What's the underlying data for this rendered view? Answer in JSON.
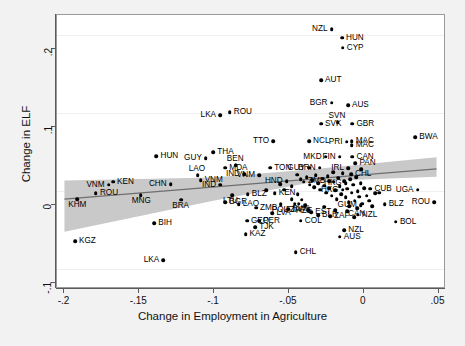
{
  "chart_data": {
    "type": "scatter",
    "title": "",
    "xlabel": "Change in Employment in Agriculture",
    "ylabel": "Change in ELF",
    "xlim": [
      -0.205,
      0.055
    ],
    "ylim": [
      -0.125,
      0.225
    ],
    "xticks": [
      -0.2,
      -0.15,
      -0.1,
      -0.05,
      0,
      0.05
    ],
    "xtick_labels": [
      "-.2",
      "-.15",
      "-.1",
      "-.05",
      "0",
      ".05"
    ],
    "yticks": [
      0.2,
      0.1,
      0,
      -0.1
    ],
    "ytick_labels": [
      ".2",
      ".1",
      "0",
      "-.1"
    ],
    "grid": true,
    "legend": "none",
    "marker_color": "#000000",
    "fit_line_color": "#6e6e6e",
    "ci_band_color": "#c9c9c9",
    "background_color": "#ffffff",
    "page_background": "#f2f2f2",
    "fit_line": {
      "x0": -0.2,
      "y0": -0.012,
      "x1": 0.05,
      "y1": 0.027
    },
    "ci_band": {
      "upper": [
        [
          -0.2,
          0.012
        ],
        [
          -0.1,
          0.016
        ],
        [
          -0.03,
          0.027
        ],
        [
          0.05,
          0.042
        ]
      ],
      "lower": [
        [
          -0.2,
          -0.054
        ],
        [
          -0.1,
          -0.014
        ],
        [
          -0.03,
          0.011
        ],
        [
          0.05,
          0.017
        ]
      ]
    },
    "points": [
      {
        "label": "NZL",
        "x": -0.0215,
        "y": 0.207,
        "pos": "left"
      },
      {
        "label": "HUN",
        "x": -0.0145,
        "y": 0.196,
        "pos": "right"
      },
      {
        "label": "CYP",
        "x": -0.014,
        "y": 0.183,
        "pos": "right"
      },
      {
        "label": "AUT",
        "x": -0.0285,
        "y": 0.142,
        "pos": "right"
      },
      {
        "label": "BGR",
        "x": -0.0215,
        "y": 0.113,
        "pos": "left"
      },
      {
        "label": "AUS",
        "x": -0.0105,
        "y": 0.11,
        "pos": "right"
      },
      {
        "label": "ROU",
        "x": -0.0895,
        "y": 0.101,
        "pos": "right"
      },
      {
        "label": "LKA",
        "x": -0.096,
        "y": 0.097,
        "pos": "left"
      },
      {
        "label": "SVN",
        "x": -0.0175,
        "y": 0.088,
        "pos": "above"
      },
      {
        "label": "SVK",
        "x": -0.0285,
        "y": 0.086,
        "pos": "right"
      },
      {
        "label": "GBR",
        "x": -0.0075,
        "y": 0.086,
        "pos": "right"
      },
      {
        "label": "BWA",
        "x": 0.0345,
        "y": 0.069,
        "pos": "right"
      },
      {
        "label": "NCL",
        "x": -0.0365,
        "y": 0.064,
        "pos": "right"
      },
      {
        "label": "TTO",
        "x": -0.0605,
        "y": 0.064,
        "pos": "left"
      },
      {
        "label": "PRI",
        "x": -0.0115,
        "y": 0.063,
        "pos": "left"
      },
      {
        "label": "MAC",
        "x": -0.008,
        "y": 0.064,
        "pos": "right"
      },
      {
        "label": "MAC",
        "x": -0.008,
        "y": 0.059,
        "pos": "right"
      },
      {
        "label": "THA",
        "x": -0.1005,
        "y": 0.05,
        "pos": "right"
      },
      {
        "label": "HUN",
        "x": -0.1385,
        "y": 0.045,
        "pos": "right"
      },
      {
        "label": "GUY",
        "x": -0.1055,
        "y": 0.042,
        "pos": "left"
      },
      {
        "label": "MKD",
        "x": -0.0255,
        "y": 0.044,
        "pos": "left"
      },
      {
        "label": "FIN",
        "x": -0.016,
        "y": 0.044,
        "pos": "left"
      },
      {
        "label": "CAN",
        "x": -0.0075,
        "y": 0.044,
        "pos": "right"
      },
      {
        "label": "PAN",
        "x": -0.0055,
        "y": 0.036,
        "pos": "right"
      },
      {
        "label": "BEN",
        "x": -0.0855,
        "y": 0.033,
        "pos": "above"
      },
      {
        "label": "MDA",
        "x": -0.0925,
        "y": 0.03,
        "pos": "right"
      },
      {
        "label": "TON",
        "x": -0.0625,
        "y": 0.03,
        "pos": "right"
      },
      {
        "label": "GUY",
        "x": -0.0365,
        "y": 0.03,
        "pos": "left"
      },
      {
        "label": "BRN",
        "x": -0.0295,
        "y": 0.03,
        "pos": "left"
      },
      {
        "label": "IRL",
        "x": -0.0105,
        "y": 0.029,
        "pos": "left"
      },
      {
        "label": "CHL",
        "x": -0.0085,
        "y": 0.022,
        "pos": "right"
      },
      {
        "label": "LAO",
        "x": -0.111,
        "y": 0.02,
        "pos": "above"
      },
      {
        "label": "IND",
        "x": -0.08,
        "y": 0.022,
        "pos": "left"
      },
      {
        "label": "VNM",
        "x": -0.07,
        "y": 0.02,
        "pos": "left"
      },
      {
        "label": "VNM",
        "x": -0.109,
        "y": 0.014,
        "pos": "right"
      },
      {
        "label": "CHN",
        "x": -0.129,
        "y": 0.009,
        "pos": "left"
      },
      {
        "label": "IND",
        "x": -0.096,
        "y": 0.008,
        "pos": "left"
      },
      {
        "label": "HKG",
        "x": -0.012,
        "y": 0.01,
        "pos": "left"
      },
      {
        "label": "ZMB",
        "x": -0.023,
        "y": 0.013,
        "pos": "left"
      },
      {
        "label": "HND",
        "x": -0.0515,
        "y": 0.013,
        "pos": "left"
      },
      {
        "label": "HKG",
        "x": -0.014,
        "y": 0.002,
        "pos": "left"
      },
      {
        "label": "CUB",
        "x": 0.0045,
        "y": 0.003,
        "pos": "right"
      },
      {
        "label": "UGA",
        "x": 0.036,
        "y": 0.002,
        "pos": "left"
      },
      {
        "label": "VNM",
        "x": -0.1705,
        "y": 0.008,
        "pos": "left"
      },
      {
        "label": "KEN",
        "x": -0.1675,
        "y": 0.012,
        "pos": "right"
      },
      {
        "label": "ROU",
        "x": -0.179,
        "y": -0.003,
        "pos": "right"
      },
      {
        "label": "KHM",
        "x": -0.1915,
        "y": -0.01,
        "pos": "below"
      },
      {
        "label": "MNG",
        "x": -0.149,
        "y": -0.005,
        "pos": "below"
      },
      {
        "label": "BRA",
        "x": -0.122,
        "y": -0.011,
        "pos": "below"
      },
      {
        "label": "LTU",
        "x": -0.088,
        "y": -0.005,
        "pos": "below"
      },
      {
        "label": "BLZ",
        "x": -0.0775,
        "y": -0.004,
        "pos": "right"
      },
      {
        "label": "KEN",
        "x": -0.0595,
        "y": -0.003,
        "pos": "right"
      },
      {
        "label": "BGR",
        "x": -0.0925,
        "y": -0.014,
        "pos": "right"
      },
      {
        "label": "LAO",
        "x": -0.0835,
        "y": -0.017,
        "pos": "right"
      },
      {
        "label": "ZMB",
        "x": -0.072,
        "y": -0.021,
        "pos": "right"
      },
      {
        "label": "POL",
        "x": -0.0555,
        "y": -0.017,
        "pos": "below"
      },
      {
        "label": "FJI",
        "x": -0.046,
        "y": -0.016,
        "pos": "below"
      },
      {
        "label": "ZAF",
        "x": -0.0435,
        "y": -0.016,
        "pos": "below"
      },
      {
        "label": "AZE",
        "x": -0.039,
        "y": -0.018,
        "pos": "below"
      },
      {
        "label": "RWA",
        "x": -0.0505,
        "y": -0.023,
        "pos": "right"
      },
      {
        "label": "LVA",
        "x": -0.061,
        "y": -0.028,
        "pos": "right"
      },
      {
        "label": "EST",
        "x": -0.035,
        "y": -0.027,
        "pos": "right"
      },
      {
        "label": "BLR",
        "x": -0.0305,
        "y": -0.031,
        "pos": "right"
      },
      {
        "label": "ZAF",
        "x": -0.0225,
        "y": -0.032,
        "pos": "right"
      },
      {
        "label": "COL",
        "x": -0.042,
        "y": -0.038,
        "pos": "right"
      },
      {
        "label": "GEO",
        "x": -0.078,
        "y": -0.038,
        "pos": "right"
      },
      {
        "label": "PER",
        "x": -0.07,
        "y": -0.038,
        "pos": "right"
      },
      {
        "label": "TJK",
        "x": -0.0725,
        "y": -0.046,
        "pos": "right"
      },
      {
        "label": "KAZ",
        "x": -0.079,
        "y": -0.055,
        "pos": "right"
      },
      {
        "label": "CAN",
        "x": -0.0045,
        "y": -0.022,
        "pos": "below"
      },
      {
        "label": "NZL",
        "x": -0.004,
        "y": -0.03,
        "pos": "right"
      },
      {
        "label": "GUM",
        "x": -0.002,
        "y": -0.018,
        "pos": "left"
      },
      {
        "label": "BLZ",
        "x": 0.014,
        "y": -0.017,
        "pos": "right"
      },
      {
        "label": "ROU",
        "x": 0.047,
        "y": -0.014,
        "pos": "left"
      },
      {
        "label": "BOL",
        "x": 0.0215,
        "y": -0.039,
        "pos": "right"
      },
      {
        "label": "NZL",
        "x": -0.013,
        "y": -0.05,
        "pos": "right"
      },
      {
        "label": "AUS",
        "x": -0.016,
        "y": -0.058,
        "pos": "right"
      },
      {
        "label": "CHL",
        "x": -0.0455,
        "y": -0.078,
        "pos": "right"
      },
      {
        "label": "BIH",
        "x": -0.14,
        "y": -0.041,
        "pos": "right"
      },
      {
        "label": "KGZ",
        "x": -0.193,
        "y": -0.064,
        "pos": "right"
      },
      {
        "label": "LKA",
        "x": -0.134,
        "y": -0.088,
        "pos": "left"
      }
    ],
    "extra_points": [
      {
        "x": -0.042,
        "y": 0.015
      },
      {
        "x": -0.04,
        "y": 0.012
      },
      {
        "x": -0.038,
        "y": 0.018
      },
      {
        "x": -0.036,
        "y": 0.008
      },
      {
        "x": -0.0345,
        "y": 0.014
      },
      {
        "x": -0.033,
        "y": 0.005
      },
      {
        "x": -0.032,
        "y": 0.02
      },
      {
        "x": -0.0305,
        "y": 0.01
      },
      {
        "x": -0.029,
        "y": 0.002
      },
      {
        "x": -0.0275,
        "y": 0.016
      },
      {
        "x": -0.0265,
        "y": 0.007
      },
      {
        "x": -0.025,
        "y": -0.002
      },
      {
        "x": -0.024,
        "y": 0.019
      },
      {
        "x": -0.023,
        "y": 0.004
      },
      {
        "x": -0.0215,
        "y": -0.006
      },
      {
        "x": -0.02,
        "y": 0.012
      },
      {
        "x": -0.019,
        "y": 0.001
      },
      {
        "x": -0.018,
        "y": -0.01
      },
      {
        "x": -0.017,
        "y": 0.017
      },
      {
        "x": -0.016,
        "y": 0.006
      },
      {
        "x": -0.015,
        "y": -0.004
      },
      {
        "x": -0.014,
        "y": 0.023
      },
      {
        "x": -0.013,
        "y": 0.013
      },
      {
        "x": -0.012,
        "y": -0.008
      },
      {
        "x": -0.011,
        "y": 0.003
      },
      {
        "x": -0.01,
        "y": -0.014
      },
      {
        "x": -0.009,
        "y": 0.015
      },
      {
        "x": -0.008,
        "y": -0.002
      },
      {
        "x": -0.007,
        "y": 0.008
      },
      {
        "x": -0.006,
        "y": -0.012
      },
      {
        "x": -0.005,
        "y": 0.018
      },
      {
        "x": -0.004,
        "y": 0.0
      },
      {
        "x": -0.003,
        "y": -0.007
      },
      {
        "x": -0.002,
        "y": 0.01
      },
      {
        "x": -0.001,
        "y": -0.016
      },
      {
        "x": 0.0005,
        "y": 0.004
      },
      {
        "x": 0.002,
        "y": -0.006
      },
      {
        "x": 0.0035,
        "y": -0.012
      },
      {
        "x": 0.0055,
        "y": -0.019
      },
      {
        "x": 0.0075,
        "y": -0.003
      },
      {
        "x": -0.048,
        "y": 0.006
      },
      {
        "x": -0.053,
        "y": 0.002
      },
      {
        "x": -0.056,
        "y": 0.009
      },
      {
        "x": -0.065,
        "y": 0.001
      },
      {
        "x": -0.048,
        "y": -0.01
      },
      {
        "x": -0.044,
        "y": -0.004
      },
      {
        "x": -0.0415,
        "y": -0.011
      },
      {
        "x": -0.037,
        "y": -0.024
      },
      {
        "x": -0.0265,
        "y": -0.02
      },
      {
        "x": -0.019,
        "y": -0.024
      },
      {
        "x": -0.011,
        "y": -0.026
      },
      {
        "x": -0.0065,
        "y": -0.033
      },
      {
        "x": -0.0095,
        "y": -0.019
      },
      {
        "x": 0.0105,
        "y": -0.002
      },
      {
        "x": -0.0015,
        "y": 0.028
      },
      {
        "x": -0.0205,
        "y": 0.024
      },
      {
        "x": -0.0445,
        "y": 0.021
      }
    ]
  }
}
